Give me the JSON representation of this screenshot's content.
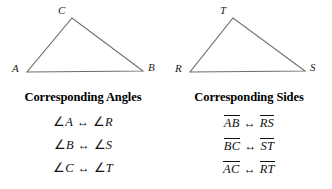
{
  "figure": {
    "triangles": [
      {
        "name": "triangle-abc",
        "vertices": [
          {
            "label": "A",
            "x": 27,
            "y": 72
          },
          {
            "label": "B",
            "x": 143,
            "y": 71
          },
          {
            "label": "C",
            "x": 72,
            "y": 18
          }
        ],
        "label_positions": [
          {
            "label": "A",
            "left": 12,
            "top": 63
          },
          {
            "label": "B",
            "left": 148,
            "top": 62
          },
          {
            "label": "C",
            "left": 58,
            "top": 5
          }
        ],
        "stroke": "#6e6e6e"
      },
      {
        "name": "triangle-rst",
        "vertices": [
          {
            "label": "R",
            "x": 190,
            "y": 72
          },
          {
            "label": "S",
            "x": 305,
            "y": 71
          },
          {
            "label": "T",
            "x": 233,
            "y": 18
          }
        ],
        "label_positions": [
          {
            "label": "R",
            "left": 175,
            "top": 63
          },
          {
            "label": "S",
            "left": 310,
            "top": 62
          },
          {
            "label": "T",
            "left": 220,
            "top": 5
          }
        ],
        "stroke": "#6e6e6e"
      }
    ]
  },
  "columns": [
    {
      "heading": "Corresponding Angles",
      "kind": "angles",
      "pairs": [
        {
          "left": "A",
          "right": "R"
        },
        {
          "left": "B",
          "right": "S"
        },
        {
          "left": "C",
          "right": "T"
        }
      ]
    },
    {
      "heading": "Corresponding Sides",
      "kind": "segments",
      "pairs": [
        {
          "left": "AB",
          "right": "RS"
        },
        {
          "left": "BC",
          "right": "ST"
        },
        {
          "left": "AC",
          "right": "RT"
        }
      ]
    }
  ],
  "symbols": {
    "angle": "∠",
    "correspondence_arrow": "↔"
  },
  "colors": {
    "line": "#6e6e6e",
    "text": "#111111",
    "heading": "#000000",
    "background": "#ffffff"
  }
}
